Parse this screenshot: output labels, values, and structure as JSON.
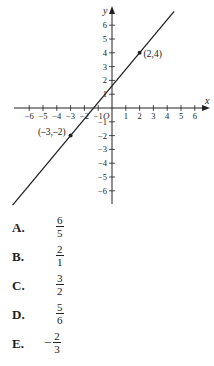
{
  "chart_data": {
    "type": "line",
    "title": "",
    "xlabel": "x",
    "ylabel": "y",
    "origin_label": "O",
    "xlim": [
      -6,
      6
    ],
    "ylim": [
      -6,
      6
    ],
    "x_ticks": [
      -6,
      -5,
      -4,
      -3,
      -2,
      -1,
      1,
      2,
      3,
      4,
      5,
      6
    ],
    "y_ticks": [
      -6,
      -5,
      -4,
      -3,
      -2,
      -1,
      1,
      2,
      3,
      4,
      5,
      6
    ],
    "grid": false,
    "series": [
      {
        "name": "line",
        "x": [
          -3,
          2
        ],
        "y": [
          -2,
          4
        ],
        "slope": 1.2
      }
    ],
    "points": [
      {
        "x": 2,
        "y": 4,
        "label": "(2,4)"
      },
      {
        "x": -3,
        "y": -2,
        "label": "(–3,–2)"
      }
    ]
  },
  "choices": [
    {
      "letter": "A.",
      "negative": "",
      "num": "6",
      "den": "5"
    },
    {
      "letter": "B.",
      "negative": "",
      "num": "2",
      "den": "1"
    },
    {
      "letter": "C.",
      "negative": "",
      "num": "3",
      "den": "2"
    },
    {
      "letter": "D.",
      "negative": "",
      "num": "5",
      "den": "6"
    },
    {
      "letter": "E.",
      "negative": "−",
      "num": "2",
      "den": "3"
    }
  ]
}
